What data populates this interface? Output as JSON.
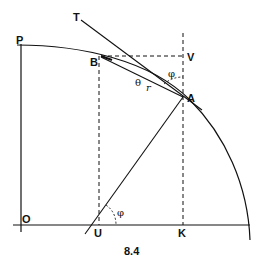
{
  "figure": {
    "caption": "8.4",
    "points": {
      "P": "P",
      "B": "B",
      "V": "V",
      "A": "A",
      "T": "T",
      "O": "O",
      "U": "U",
      "K": "K"
    },
    "angle_labels": {
      "phi_top": "φ",
      "theta": "θ",
      "r": "r",
      "phi_bottom": "φ"
    }
  }
}
